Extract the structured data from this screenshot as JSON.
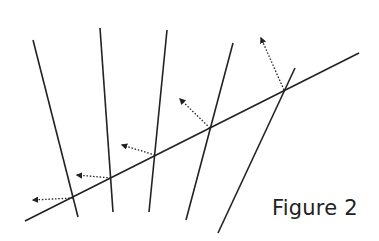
{
  "caption": "Figure 2",
  "colors": {
    "line": "#222222",
    "background": "#ffffff"
  },
  "diagram": {
    "transversal": {
      "x1": 25,
      "y1": 221,
      "x2": 359,
      "y2": 53
    },
    "lines": [
      {
        "x1": 33,
        "y1": 40,
        "x2": 78,
        "y2": 217
      },
      {
        "x1": 100,
        "y1": 28,
        "x2": 113,
        "y2": 212
      },
      {
        "x1": 167,
        "y1": 30,
        "x2": 149,
        "y2": 212
      },
      {
        "x1": 233,
        "y1": 43,
        "x2": 186,
        "y2": 220
      },
      {
        "x1": 295,
        "y1": 68,
        "x2": 218,
        "y2": 233
      }
    ],
    "arrows": [
      {
        "x1": 73,
        "y1": 198,
        "x2": 33,
        "y2": 200
      },
      {
        "x1": 111,
        "y1": 178,
        "x2": 77,
        "y2": 175
      },
      {
        "x1": 155,
        "y1": 155,
        "x2": 122,
        "y2": 145
      },
      {
        "x1": 210,
        "y1": 128,
        "x2": 180,
        "y2": 99
      },
      {
        "x1": 284,
        "y1": 90,
        "x2": 261,
        "y2": 38
      }
    ]
  }
}
